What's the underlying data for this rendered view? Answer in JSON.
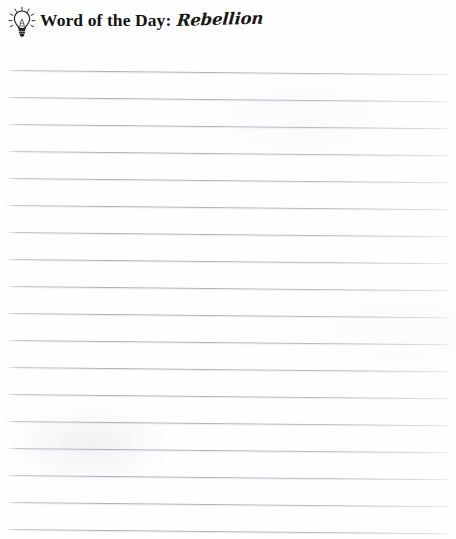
{
  "page": {
    "background_color": "#fefefe",
    "width": 456,
    "height": 539
  },
  "header": {
    "icon": "lightbulb-icon",
    "label": "Word of the Day:",
    "word": "Rebellion",
    "text_color": "#131313"
  },
  "writing_area": {
    "line_color": "#a8aab0",
    "line_count": 17,
    "first_line_y": 70,
    "line_spacing": 27,
    "line_left": 6,
    "line_width": 443,
    "slant_degrees": 0.55,
    "lines": [
      {
        "index": 1,
        "y": 70,
        "content": ""
      },
      {
        "index": 2,
        "y": 97,
        "content": ""
      },
      {
        "index": 3,
        "y": 124,
        "content": ""
      },
      {
        "index": 4,
        "y": 151,
        "content": ""
      },
      {
        "index": 5,
        "y": 178,
        "content": ""
      },
      {
        "index": 6,
        "y": 205,
        "content": ""
      },
      {
        "index": 7,
        "y": 232,
        "content": ""
      },
      {
        "index": 8,
        "y": 259,
        "content": ""
      },
      {
        "index": 9,
        "y": 286,
        "content": ""
      },
      {
        "index": 10,
        "y": 313,
        "content": ""
      },
      {
        "index": 11,
        "y": 340,
        "content": ""
      },
      {
        "index": 12,
        "y": 367,
        "content": ""
      },
      {
        "index": 13,
        "y": 394,
        "content": ""
      },
      {
        "index": 14,
        "y": 421,
        "content": ""
      },
      {
        "index": 15,
        "y": 448,
        "content": ""
      },
      {
        "index": 16,
        "y": 475,
        "content": ""
      },
      {
        "index": 17,
        "y": 502,
        "content": ""
      },
      {
        "index": 18,
        "y": 529,
        "content": ""
      }
    ]
  }
}
